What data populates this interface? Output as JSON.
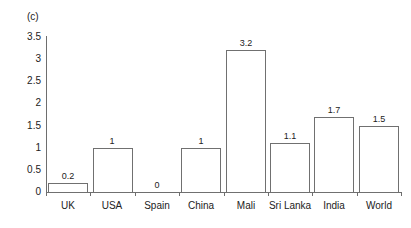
{
  "panel": {
    "label": "(c)"
  },
  "chart_data": {
    "type": "bar",
    "title": "",
    "subtitle": "",
    "xlabel": "",
    "ylabel": "",
    "categories": [
      "UK",
      "USA",
      "Spain",
      "China",
      "Mali",
      "Sri Lanka",
      "India",
      "World"
    ],
    "values": [
      0.2,
      1,
      0,
      1,
      3.2,
      1.1,
      1.7,
      1.5
    ],
    "value_labels": [
      "0.2",
      "1",
      "0",
      "1",
      "3.2",
      "1.1",
      "1.7",
      "1.5"
    ],
    "ylim": [
      0,
      3.5
    ],
    "ytick_labels": [
      "3.5",
      "3",
      "2.5",
      "2",
      "1.5",
      "1",
      "0.5",
      "0"
    ],
    "ytick_values": [
      3.5,
      3,
      2.5,
      2,
      1.5,
      1,
      0.5,
      0
    ],
    "grid": false,
    "legend": "none",
    "bar_fill": "#ffffff",
    "bar_edge": "#707070",
    "axis_color": "#6e6e6e",
    "text_color": "#222222"
  }
}
